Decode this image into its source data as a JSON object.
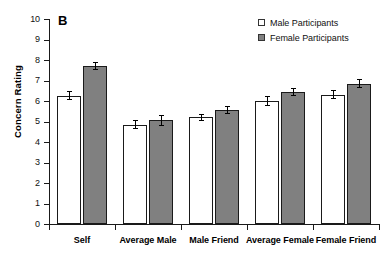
{
  "chart_data": {
    "type": "bar",
    "title": "",
    "panel_label": "B",
    "xlabel": "",
    "ylabel": "Concern Rating",
    "ylim": [
      0,
      10
    ],
    "ytick_labels": [
      "10",
      "9",
      "8",
      "7",
      "6",
      "5",
      "4",
      "3",
      "2",
      "1",
      "0"
    ],
    "ytick_values": [
      10,
      9,
      8,
      7,
      6,
      5,
      4,
      3,
      2,
      1,
      0
    ],
    "grid": false,
    "legend_position": "top-right",
    "categories": [
      "Self",
      "Average Male",
      "Male Friend",
      "Average Female",
      "Female Friend"
    ],
    "series": [
      {
        "name": "Male Participants",
        "color": "#ffffff",
        "edge_color": "#1a1a1a",
        "values": [
          6.25,
          4.85,
          5.2,
          6.0,
          6.3
        ],
        "errors": [
          0.22,
          0.22,
          0.18,
          0.25,
          0.22
        ]
      },
      {
        "name": "Female Participants",
        "color": "#808080",
        "edge_color": "#1a1a1a",
        "values": [
          7.7,
          5.05,
          5.55,
          6.45,
          6.85
        ],
        "errors": [
          0.2,
          0.25,
          0.2,
          0.2,
          0.2
        ]
      }
    ]
  },
  "legend": {
    "items": [
      {
        "label": "Male Participants",
        "swatch": "open-square-swatch"
      },
      {
        "label": "Female Participants",
        "swatch": "filled-square-swatch"
      }
    ]
  },
  "colors": {
    "female_bar": "#808080",
    "male_bar": "#ffffff",
    "axis": "#1a1a1a",
    "background": "#ffffff"
  }
}
